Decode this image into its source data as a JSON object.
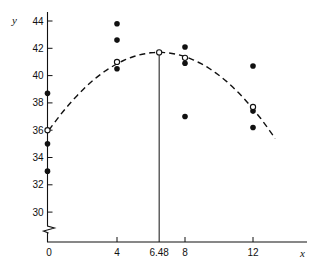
{
  "chart_data": {
    "type": "scatter",
    "title": "",
    "xlabel": "x",
    "ylabel": "y",
    "xlim": [
      0,
      14
    ],
    "ylim": [
      28.5,
      45
    ],
    "y_axis_break": true,
    "grid": false,
    "x_ticks": [
      {
        "value": 0,
        "label": "0"
      },
      {
        "value": 4,
        "label": "4"
      },
      {
        "value": 6.48,
        "label": "6.48"
      },
      {
        "value": 8,
        "label": "8"
      },
      {
        "value": 12,
        "label": "12"
      }
    ],
    "y_ticks": [
      {
        "value": 30,
        "label": "30"
      },
      {
        "value": 32,
        "label": "32"
      },
      {
        "value": 34,
        "label": "34"
      },
      {
        "value": 36,
        "label": "36"
      },
      {
        "value": 38,
        "label": "38"
      },
      {
        "value": 40,
        "label": "40"
      },
      {
        "value": 42,
        "label": "42"
      },
      {
        "value": 44,
        "label": "44"
      }
    ],
    "series": [
      {
        "name": "observations",
        "marker": "filled-circle",
        "points": [
          {
            "x": 0,
            "y": 38.7
          },
          {
            "x": 0,
            "y": 35.0
          },
          {
            "x": 0,
            "y": 33.0
          },
          {
            "x": 4,
            "y": 43.8
          },
          {
            "x": 4,
            "y": 42.6
          },
          {
            "x": 4,
            "y": 40.5
          },
          {
            "x": 8,
            "y": 42.1
          },
          {
            "x": 8,
            "y": 40.9
          },
          {
            "x": 8,
            "y": 37.0
          },
          {
            "x": 12,
            "y": 40.7
          },
          {
            "x": 12,
            "y": 37.4
          },
          {
            "x": 12,
            "y": 36.2
          }
        ]
      },
      {
        "name": "fitted means",
        "marker": "open-circle",
        "points": [
          {
            "x": 0,
            "y": 36.0
          },
          {
            "x": 4,
            "y": 41.0
          },
          {
            "x": 6.48,
            "y": 41.7
          },
          {
            "x": 8,
            "y": 41.3
          },
          {
            "x": 12,
            "y": 37.7
          }
        ]
      },
      {
        "name": "fitted quadratic",
        "style": "dashed",
        "equation": "y = 41.7 - 0.1357*(x - 6.48)^2",
        "x_range": [
          0,
          13.3
        ]
      }
    ],
    "annotations": [
      {
        "type": "vertical-line",
        "x": 6.48,
        "from_y": "axis",
        "to_y": 41.7,
        "label": "6.48"
      }
    ]
  }
}
